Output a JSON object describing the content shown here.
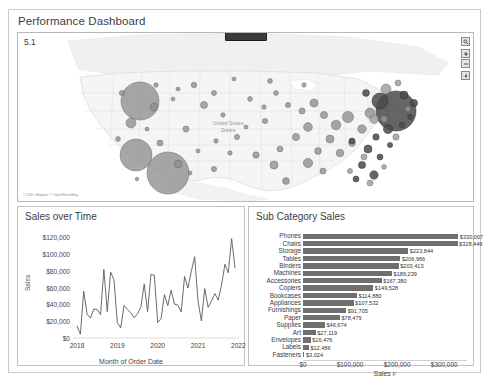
{
  "dashboard": {
    "title": "Performance Dashboard",
    "map_sheet_id": "5.1",
    "map_attribution": "© 2021 Mapbox © OpenStreetMap",
    "map_place_label": "United States",
    "map_controls": [
      {
        "name": "map-search-icon",
        "glyph": "⌕"
      },
      {
        "name": "map-zoom-in-icon",
        "glyph": "+"
      },
      {
        "name": "map-zoom-out-icon",
        "glyph": "−"
      },
      {
        "name": "map-pan-icon",
        "glyph": "✥"
      }
    ]
  },
  "line_chart": {
    "title": "Sales over Time"
  },
  "bar_chart": {
    "title": "Sub Category Sales",
    "sort_glyph": "F"
  },
  "chart_data": [
    {
      "type": "line",
      "title": "Sales over Time",
      "xlabel": "Month of Order Date",
      "ylabel": "Sales",
      "ylim": [
        0,
        130000
      ],
      "yticks": [
        "$0",
        "$20,000",
        "$40,000",
        "$60,000",
        "$80,000",
        "$100,000",
        "$120,000"
      ],
      "ytick_values": [
        0,
        20000,
        40000,
        60000,
        80000,
        100000,
        120000
      ],
      "xticks": [
        "2018",
        "2019",
        "2020",
        "2021",
        "2022"
      ],
      "xtick_values": [
        2018,
        2019,
        2020,
        2021,
        2022
      ],
      "grid": false,
      "legend": "none",
      "x": [
        "2018-01",
        "2018-02",
        "2018-03",
        "2018-04",
        "2018-05",
        "2018-06",
        "2018-07",
        "2018-08",
        "2018-09",
        "2018-10",
        "2018-11",
        "2018-12",
        "2019-01",
        "2019-02",
        "2019-03",
        "2019-04",
        "2019-05",
        "2019-06",
        "2019-07",
        "2019-08",
        "2019-09",
        "2019-10",
        "2019-11",
        "2019-12",
        "2020-01",
        "2020-02",
        "2020-03",
        "2020-04",
        "2020-05",
        "2020-06",
        "2020-07",
        "2020-08",
        "2020-09",
        "2020-10",
        "2020-11",
        "2020-12",
        "2021-01",
        "2021-02",
        "2021-03",
        "2021-04",
        "2021-05",
        "2021-06",
        "2021-07",
        "2021-08",
        "2021-09",
        "2021-10",
        "2021-11",
        "2021-12"
      ],
      "values": [
        14236,
        4520,
        55691,
        28295,
        23648,
        34595,
        33946,
        27909,
        81777,
        31453,
        78629,
        69545,
        18174,
        11951,
        38726,
        34196,
        30132,
        24221,
        28887,
        36818,
        64595,
        31404,
        75972,
        74920,
        18542,
        22979,
        51715,
        38750,
        56987,
        40344,
        39262,
        31116,
        73410,
        59687,
        79412,
        96999,
        43971,
        20301,
        58872,
        36522,
        44261,
        52982,
        45264,
        63121,
        87866,
        77777,
        118448,
        83830
      ]
    },
    {
      "type": "bar",
      "orientation": "horizontal",
      "title": "Sub Category Sales",
      "xlabel": "Sales",
      "ylabel": "",
      "xlim": [
        0,
        340000
      ],
      "xticks": [
        "$0",
        "$100,000",
        "$200,000",
        "$300,000"
      ],
      "xtick_values": [
        0,
        100000,
        200000,
        300000
      ],
      "bar_color": "#6f6f6f",
      "grid": false,
      "legend": "none",
      "categories": [
        "Phones",
        "Chairs",
        "Storage",
        "Tables",
        "Binders",
        "Machines",
        "Accessories",
        "Copiers",
        "Bookcases",
        "Appliances",
        "Furnishings",
        "Paper",
        "Supplies",
        "Art",
        "Envelopes",
        "Labels",
        "Fasteners"
      ],
      "values": [
        330007,
        328449,
        223844,
        206966,
        203413,
        189239,
        167380,
        149528,
        114880,
        107532,
        91705,
        78479,
        46674,
        27119,
        16476,
        12486,
        3024
      ],
      "value_labels": [
        "$330,007",
        "$328,449",
        "$223,844",
        "$206,966",
        "$203,413",
        "$189,239",
        "$167,380",
        "$149,528",
        "$114,880",
        "$107,532",
        "$91,705",
        "$78,479",
        "$46,674",
        "$27,119",
        "$16,476",
        "$12,486",
        "$3,024"
      ]
    },
    {
      "type": "scatter",
      "subtype": "symbol-map",
      "title": "",
      "region": "United States",
      "size_field": "Sales",
      "marker_color": "#7b7b7b"
    }
  ]
}
